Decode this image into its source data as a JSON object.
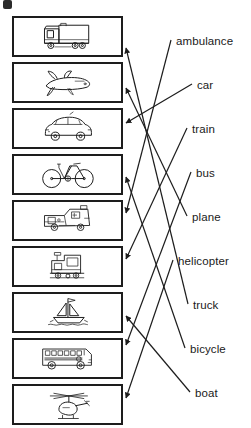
{
  "worksheet": {
    "type": "matching-exercise",
    "title": "Vehicles matching worksheet",
    "corner_mark": "bullet-mark",
    "stroke_color": "#1d1d1d",
    "text_color": "#1a1a1a",
    "background_color": "#ffffff"
  },
  "pictures": [
    {
      "id": "pic-truck",
      "index": 1,
      "name": "truck",
      "icon": "truck-icon",
      "x": 12,
      "y": 16,
      "w": 111,
      "h": 41,
      "arrow_y": 48
    },
    {
      "id": "pic-plane",
      "index": 2,
      "name": "plane",
      "icon": "plane-icon",
      "x": 12,
      "y": 62,
      "w": 111,
      "h": 41,
      "arrow_y": 88
    },
    {
      "id": "pic-car",
      "index": 3,
      "name": "car",
      "icon": "car-icon",
      "x": 12,
      "y": 108,
      "w": 111,
      "h": 41,
      "arrow_y": 123
    },
    {
      "id": "pic-bicycle",
      "index": 4,
      "name": "bicycle",
      "icon": "bicycle-icon",
      "x": 12,
      "y": 154,
      "w": 111,
      "h": 41,
      "arrow_y": 177
    },
    {
      "id": "pic-ambulance",
      "index": 5,
      "name": "ambulance",
      "icon": "ambulance-icon",
      "x": 12,
      "y": 200,
      "w": 111,
      "h": 41,
      "arrow_y": 213
    },
    {
      "id": "pic-train",
      "index": 6,
      "name": "train",
      "icon": "train-icon",
      "x": 12,
      "y": 246,
      "w": 111,
      "h": 41,
      "arrow_y": 259
    },
    {
      "id": "pic-boat",
      "index": 7,
      "name": "boat",
      "icon": "boat-icon",
      "x": 12,
      "y": 292,
      "w": 111,
      "h": 41,
      "arrow_y": 316
    },
    {
      "id": "pic-bus",
      "index": 8,
      "name": "bus",
      "icon": "bus-icon",
      "x": 12,
      "y": 338,
      "w": 111,
      "h": 41,
      "arrow_y": 345
    },
    {
      "id": "pic-helicopter",
      "index": 9,
      "name": "helicopter",
      "icon": "helicopter-icon",
      "x": 12,
      "y": 384,
      "w": 111,
      "h": 41,
      "arrow_y": 398
    }
  ],
  "labels": [
    {
      "id": "label-ambulance",
      "text": "ambulance",
      "x": 176,
      "y": 36,
      "anchor_x": 171,
      "anchor_y": 40
    },
    {
      "id": "label-car",
      "text": "car",
      "x": 197,
      "y": 80,
      "anchor_x": 192,
      "anchor_y": 84
    },
    {
      "id": "label-train",
      "text": "train",
      "x": 192,
      "y": 124,
      "anchor_x": 187,
      "anchor_y": 128
    },
    {
      "id": "label-bus",
      "text": "bus",
      "x": 196,
      "y": 168,
      "anchor_x": 191,
      "anchor_y": 172
    },
    {
      "id": "label-plane",
      "text": "plane",
      "x": 192,
      "y": 212,
      "anchor_x": 187,
      "anchor_y": 216
    },
    {
      "id": "label-helicopter",
      "text": "helicopter",
      "x": 178,
      "y": 256,
      "anchor_x": 173,
      "anchor_y": 260
    },
    {
      "id": "label-truck",
      "text": "truck",
      "x": 193,
      "y": 300,
      "anchor_x": 188,
      "anchor_y": 304
    },
    {
      "id": "label-bicycle",
      "text": "bicycle",
      "x": 190,
      "y": 344,
      "anchor_x": 185,
      "anchor_y": 348
    },
    {
      "id": "label-boat",
      "text": "boat",
      "x": 195,
      "y": 388,
      "anchor_x": 190,
      "anchor_y": 392
    }
  ],
  "connections": [
    {
      "id": "conn-ambulance",
      "label": "ambulance",
      "picture": "ambulance",
      "from_x": 171,
      "from_y": 40,
      "to_x": 126,
      "to_y": 213
    },
    {
      "id": "conn-car",
      "label": "car",
      "picture": "car",
      "from_x": 192,
      "from_y": 84,
      "to_x": 126,
      "to_y": 123
    },
    {
      "id": "conn-train",
      "label": "train",
      "picture": "train",
      "from_x": 187,
      "from_y": 128,
      "to_x": 126,
      "to_y": 259
    },
    {
      "id": "conn-bus",
      "label": "bus",
      "picture": "bus",
      "from_x": 191,
      "from_y": 172,
      "to_x": 126,
      "to_y": 345
    },
    {
      "id": "conn-plane",
      "label": "plane",
      "picture": "plane",
      "from_x": 187,
      "from_y": 216,
      "to_x": 126,
      "to_y": 88
    },
    {
      "id": "conn-helicopter",
      "label": "helicopter",
      "picture": "helicopter",
      "from_x": 173,
      "from_y": 260,
      "to_x": 126,
      "to_y": 398
    },
    {
      "id": "conn-truck",
      "label": "truck",
      "picture": "truck",
      "from_x": 188,
      "from_y": 304,
      "to_x": 126,
      "to_y": 48
    },
    {
      "id": "conn-bicycle",
      "label": "bicycle",
      "picture": "bicycle",
      "from_x": 185,
      "from_y": 348,
      "to_x": 126,
      "to_y": 177
    },
    {
      "id": "conn-boat",
      "label": "boat",
      "picture": "boat",
      "from_x": 190,
      "from_y": 392,
      "to_x": 126,
      "to_y": 316
    }
  ]
}
